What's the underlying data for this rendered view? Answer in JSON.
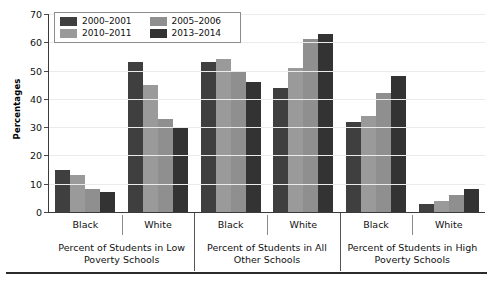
{
  "chart_data": {
    "type": "bar",
    "title": "",
    "xlabel": "",
    "ylabel": "Percentages",
    "ylim": [
      0,
      70
    ],
    "yticks": [
      0,
      10,
      20,
      30,
      40,
      50,
      60,
      70
    ],
    "grid": true,
    "legend_position": "top-left-inside",
    "categories": [
      "Black / Low Poverty",
      "White / Low Poverty",
      "Black / All Other",
      "White / All Other",
      "Black / High Poverty",
      "White / High Poverty"
    ],
    "series": [
      {
        "name": "2000–2001",
        "color": "#3f3f3f",
        "values": [
          15,
          53,
          53,
          44,
          32,
          3
        ]
      },
      {
        "name": "2010–2011",
        "color": "#9a9a9a",
        "values": [
          13,
          45,
          54,
          51,
          34,
          4
        ]
      },
      {
        "name": "2005–2006",
        "color": "#8f8f8f",
        "values": [
          8,
          33,
          50,
          61,
          42,
          6
        ]
      },
      {
        "name": "2013–2014",
        "color": "#333333",
        "values": [
          7,
          30,
          46,
          63,
          48,
          8
        ]
      }
    ],
    "series_draw_order": [
      "2000–2001",
      "2010–2011",
      "2005–2006",
      "2013–2014"
    ]
  },
  "axis": {
    "y_title": "Percentages",
    "y_tick_labels": [
      "70",
      "60",
      "50",
      "40",
      "30",
      "20",
      "10",
      "0"
    ]
  },
  "legend": {
    "items": [
      {
        "label": "2000–2001",
        "color": "#3f3f3f"
      },
      {
        "label": "2005–2006",
        "color": "#8f8f8f"
      },
      {
        "label": "2010–2011",
        "color": "#9a9a9a"
      },
      {
        "label": "2013–2014",
        "color": "#333333"
      }
    ]
  },
  "x_axis": {
    "categories": [
      "Black",
      "White",
      "Black",
      "White",
      "Black",
      "White"
    ],
    "groups": [
      "Percent of Students in Low Poverty Schools",
      "Percent of Students in All Other Schools",
      "Percent of Students in High Poverty Schools"
    ]
  }
}
